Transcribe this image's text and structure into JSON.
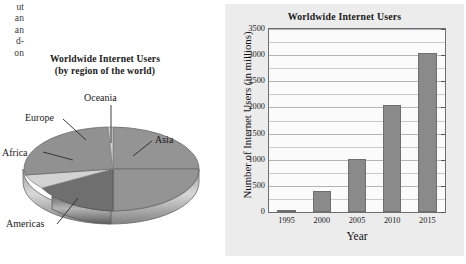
{
  "page": {
    "cut_off_text_fragments": [
      "ut",
      "an",
      "an",
      "d-",
      "on"
    ]
  },
  "pie_figure": {
    "title": "Worldwide Internet Users",
    "subtitle": "(by region of the world)",
    "labels": {
      "oceania": "Oceania",
      "europe": "Europe",
      "asia": "Asia",
      "africa": "Africa",
      "americas": "Americas"
    }
  },
  "bar_figure": {
    "title": "Worldwide Internet Users",
    "xlabel": "Year",
    "ylabel": "Number of Internet Users (in millions)"
  },
  "chart_data": [
    {
      "type": "pie",
      "title": "Worldwide Internet Users",
      "subtitle": "(by region of the world)",
      "style": "3d-pie",
      "categories": [
        "Asia",
        "Americas",
        "Africa",
        "Europe",
        "Oceania"
      ],
      "values": [
        48,
        22,
        9,
        20,
        1
      ],
      "units": "percent of worldwide internet users",
      "colors": [
        "#8f8f8f",
        "#6f6f6f",
        "#d0d0d0",
        "#8f8f8f",
        "#c8c8c8"
      ],
      "legend": "none",
      "annotations": [
        "Oceania",
        "Europe",
        "Asia",
        "Africa",
        "Americas"
      ]
    },
    {
      "type": "bar",
      "title": "Worldwide Internet Users",
      "xlabel": "Year",
      "ylabel": "Number of Internet Users (in millions)",
      "categories": [
        "1995",
        "2000",
        "2005",
        "2010",
        "2015"
      ],
      "values": [
        45,
        400,
        1020,
        2050,
        3050
      ],
      "ylim": [
        0,
        3500
      ],
      "yticks": [
        0,
        500,
        1000,
        1500,
        2000,
        2500,
        3000,
        3500
      ],
      "ytick_labels": [
        "0",
        "500",
        "1000",
        "1500",
        "2000",
        "2500",
        "3000",
        "3500"
      ],
      "minor_gridline_step": 250,
      "grid": true,
      "legend": "none",
      "bar_color": "#8a8a8a",
      "plot_background": "#fbfbfb",
      "panel_background": "#ececec"
    }
  ]
}
